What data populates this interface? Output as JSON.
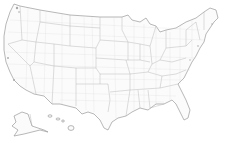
{
  "map": {
    "title": "",
    "subject": "United States county boundaries",
    "insets": [
      "alaska",
      "hawaii"
    ],
    "colors": {
      "background": "#ffffff",
      "land": "#fbfbfb",
      "coast": "#9a9a9a",
      "state_border": "#b4b4b4",
      "county_border": "#d6d6d6"
    }
  }
}
